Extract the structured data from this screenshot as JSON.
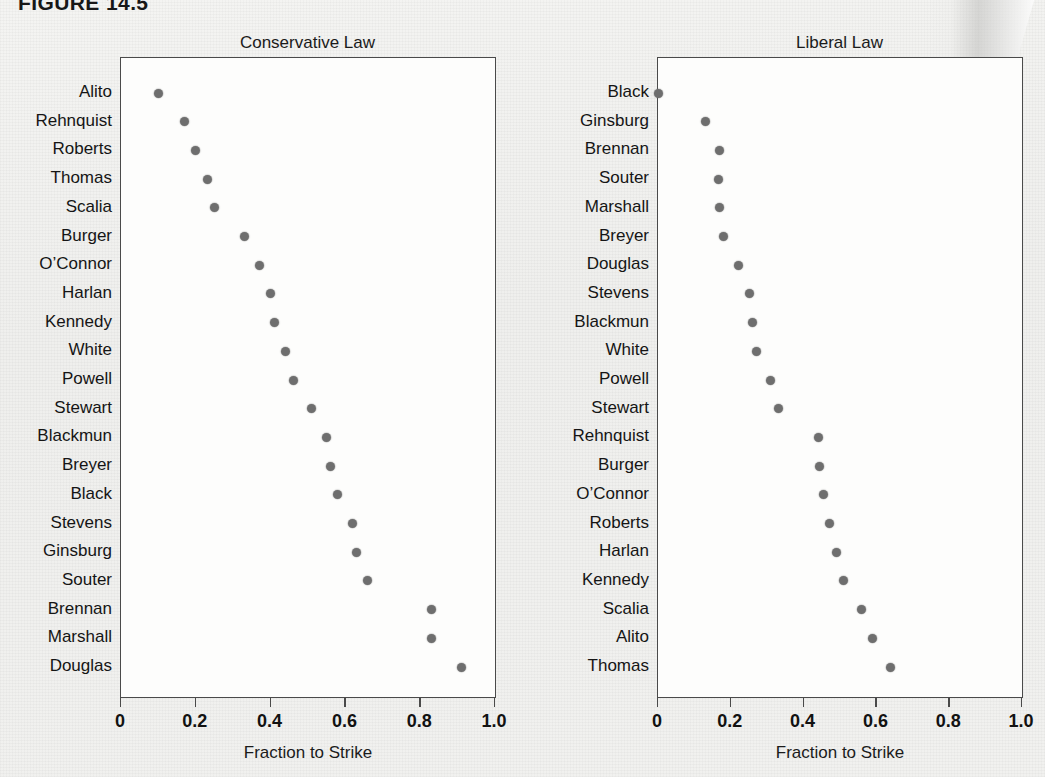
{
  "figure": {
    "number": "FIGURE 14.5"
  },
  "axis": {
    "xlabel": "Fraction to Strike",
    "ticks": [
      "0",
      "0.2",
      "0.4",
      "0.6",
      "0.8",
      "1.0"
    ],
    "tick_values": [
      0,
      0.2,
      0.4,
      0.6,
      0.8,
      1.0
    ]
  },
  "chart_data": [
    {
      "type": "scatter",
      "title": "Conservative Law",
      "xlabel": "Fraction to Strike",
      "ylabel": "",
      "xlim": [
        0,
        1.0
      ],
      "grid": false,
      "legend": "none",
      "orientation": "horizontal-dotplot",
      "categories": [
        "Alito",
        "Rehnquist",
        "Roberts",
        "Thomas",
        "Scalia",
        "Burger",
        "O’Connor",
        "Harlan",
        "Kennedy",
        "White",
        "Powell",
        "Stewart",
        "Blackmun",
        "Breyer",
        "Black",
        "Stevens",
        "Ginsburg",
        "Souter",
        "Brennan",
        "Marshall",
        "Douglas"
      ],
      "values": [
        0.1,
        0.17,
        0.2,
        0.23,
        0.25,
        0.33,
        0.37,
        0.4,
        0.41,
        0.44,
        0.46,
        0.51,
        0.55,
        0.56,
        0.58,
        0.62,
        0.63,
        0.66,
        0.83,
        0.83,
        0.91
      ]
    },
    {
      "type": "scatter",
      "title": "Liberal Law",
      "xlabel": "Fraction to Strike",
      "ylabel": "",
      "xlim": [
        0,
        1.0
      ],
      "grid": false,
      "legend": "none",
      "orientation": "horizontal-dotplot",
      "categories": [
        "Black",
        "Ginsburg",
        "Brennan",
        "Souter",
        "Marshall",
        "Breyer",
        "Douglas",
        "Stevens",
        "Blackmun",
        "White",
        "Powell",
        "Stewart",
        "Rehnquist",
        "Burger",
        "O’Connor",
        "Roberts",
        "Harlan",
        "Kennedy",
        "Scalia",
        "Alito",
        "Thomas"
      ],
      "values": [
        0.0,
        0.13,
        0.17,
        0.165,
        0.17,
        0.18,
        0.22,
        0.25,
        0.26,
        0.27,
        0.31,
        0.33,
        0.44,
        0.445,
        0.455,
        0.47,
        0.49,
        0.51,
        0.56,
        0.59,
        0.64
      ]
    }
  ]
}
